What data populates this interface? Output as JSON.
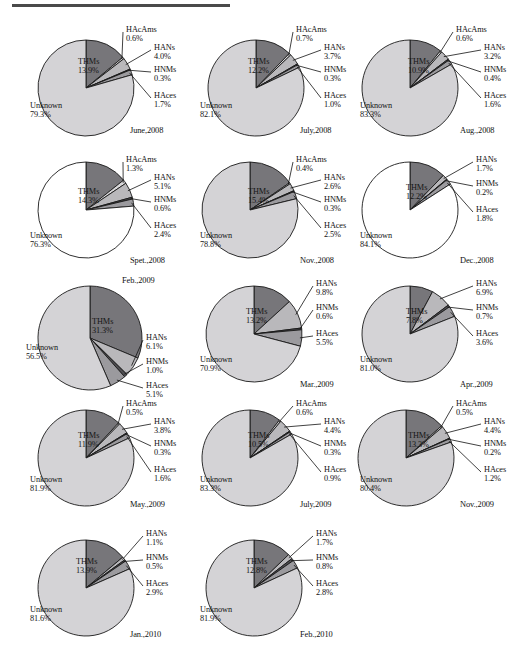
{
  "figure": {
    "title_rule": true,
    "series_names": [
      "THMs",
      "HAcAms",
      "HANs",
      "HNMs",
      "HAces",
      "Unknown"
    ],
    "colors": {
      "THMs": "#77767a",
      "HAcAms": "#d8d7d9",
      "HANs": "#b9b8bb",
      "HNMs": "#4f4e52",
      "HAces": "#9b9a9e",
      "Unknown_gray": "#d4d3d6",
      "Unknown_white": "#ffffff",
      "outline": "#1a1a1a"
    }
  },
  "chart_data": [
    {
      "type": "pie",
      "title": "June,2008",
      "unknown_fill": "gray",
      "categories": [
        "THMs",
        "HAcAms",
        "HANs",
        "HNMs",
        "HAces",
        "Unknown"
      ],
      "values": [
        13.9,
        0.6,
        4.0,
        0.3,
        1.7,
        79.3
      ],
      "labels": [
        "THMs",
        "HAcAms",
        "HANs",
        "HNMs",
        "HAces",
        "Unknown"
      ],
      "value_labels": [
        "13.9%",
        "0.6%",
        "4.0%",
        "0.3%",
        "1.7%",
        "79.3%"
      ]
    },
    {
      "type": "pie",
      "title": "July,2008",
      "unknown_fill": "gray",
      "categories": [
        "THMs",
        "HAcAms",
        "HANs",
        "HNMs",
        "HAces",
        "Unknown"
      ],
      "values": [
        12.2,
        0.7,
        3.7,
        0.3,
        1.0,
        82.1
      ],
      "labels": [
        "THMs",
        "HAcAms",
        "HANs",
        "HNMs",
        "HAces",
        "Unknown"
      ],
      "value_labels": [
        "12.2%",
        "0.7%",
        "3.7%",
        "0.3%",
        "1.0%",
        "82.1%"
      ]
    },
    {
      "type": "pie",
      "title": "Aug.,2008",
      "unknown_fill": "gray",
      "categories": [
        "THMs",
        "HAcAms",
        "HANs",
        "HNMs",
        "HAces",
        "Unknown"
      ],
      "values": [
        10.9,
        0.6,
        3.2,
        0.4,
        1.6,
        83.3
      ],
      "labels": [
        "THMs",
        "HAcAms",
        "HANs",
        "HNMs",
        "HAces",
        "Unknown"
      ],
      "value_labels": [
        "10.9%",
        "0.6%",
        "3.2%",
        "0.4%",
        "1.6%",
        "83.3%"
      ]
    },
    {
      "type": "pie",
      "title": "Spet.,2008",
      "unknown_fill": "white",
      "categories": [
        "THMs",
        "HAcAms",
        "HANs",
        "HNMs",
        "HAces",
        "Unknown"
      ],
      "values": [
        14.3,
        1.3,
        5.1,
        0.6,
        2.4,
        76.3
      ],
      "labels": [
        "THMs",
        "HAcAms",
        "HANs",
        "HNMs",
        "HAces",
        "Unknown"
      ],
      "value_labels": [
        "14.3%",
        "1.3%",
        "5.1%",
        "0.6%",
        "2.4%",
        "76.3%"
      ]
    },
    {
      "type": "pie",
      "title": "Nov.,2008",
      "unknown_fill": "gray",
      "categories": [
        "THMs",
        "HAcAms",
        "HANs",
        "HNMs",
        "HAces",
        "Unknown"
      ],
      "values": [
        15.4,
        0.4,
        2.6,
        0.3,
        2.5,
        78.8
      ],
      "labels": [
        "THMs",
        "HAcAms",
        "HANs",
        "HNMs",
        "HAces",
        "Unknown"
      ],
      "value_labels": [
        "15.4%",
        "0.4%",
        "2.6%",
        "0.3%",
        "2.5%",
        "78.8%"
      ]
    },
    {
      "type": "pie",
      "title": "Dec.,2008",
      "unknown_fill": "white",
      "categories": [
        "THMs",
        "HANs",
        "HNMs",
        "HAces",
        "Unknown"
      ],
      "values": [
        12.2,
        1.7,
        0.2,
        1.8,
        84.1
      ],
      "labels": [
        "THMs",
        "HANs",
        "HNMs",
        "HAces",
        "Unknown"
      ],
      "value_labels": [
        "12.2%",
        "1.7%",
        "0.2%",
        "1.8%",
        "84.1%"
      ]
    },
    {
      "type": "pie",
      "title": "Feb.,2009",
      "unknown_fill": "gray",
      "categories": [
        "THMs",
        "HANs",
        "HNMs",
        "HAces",
        "Unknown"
      ],
      "values": [
        31.3,
        6.1,
        1.0,
        5.1,
        56.5
      ],
      "labels": [
        "THMs",
        "HANs",
        "HNMs",
        "HAces",
        "Unknown"
      ],
      "value_labels": [
        "31.3%",
        "6.1%",
        "1.0%",
        "5.1%",
        "56.5%"
      ]
    },
    {
      "type": "pie",
      "title": "Mar.,2009",
      "unknown_fill": "gray",
      "categories": [
        "THMs",
        "HANs",
        "HNMs",
        "HAces",
        "Unknown"
      ],
      "values": [
        13.2,
        9.8,
        0.6,
        5.5,
        70.9
      ],
      "labels": [
        "THMs",
        "HANs",
        "HNMs",
        "HAces",
        "Unknown"
      ],
      "value_labels": [
        "13.2%",
        "9.8%",
        "0.6%",
        "5.5%",
        "70.9%"
      ]
    },
    {
      "type": "pie",
      "title": "Apr.,2009",
      "unknown_fill": "gray",
      "categories": [
        "THMs",
        "HANs",
        "HNMs",
        "HAces",
        "Unknown"
      ],
      "values": [
        7.8,
        6.9,
        0.7,
        3.6,
        81.0
      ],
      "labels": [
        "THMs",
        "HANs",
        "HNMs",
        "HAces",
        "Unknown"
      ],
      "value_labels": [
        "7.8%",
        "6.9%",
        "0.7%",
        "3.6%",
        "81.0%"
      ]
    },
    {
      "type": "pie",
      "title": "May.,2009",
      "unknown_fill": "gray",
      "categories": [
        "THMs",
        "HAcAms",
        "HANs",
        "HNMs",
        "HAces",
        "Unknown"
      ],
      "values": [
        11.9,
        0.5,
        3.8,
        0.3,
        1.6,
        81.9
      ],
      "labels": [
        "THMs",
        "HAcAms",
        "HANs",
        "HNMs",
        "HAces",
        "Unknown"
      ],
      "value_labels": [
        "11.9%",
        "0.5%",
        "3.8%",
        "0.3%",
        "1.6%",
        "81.9%"
      ]
    },
    {
      "type": "pie",
      "title": "July,2009",
      "unknown_fill": "gray",
      "categories": [
        "THMs",
        "HAcAms",
        "HANs",
        "HNMs",
        "HAces",
        "Unknown"
      ],
      "values": [
        10.5,
        0.6,
        4.4,
        0.3,
        0.9,
        83.3
      ],
      "labels": [
        "THMs",
        "HAcAms",
        "HANs",
        "HNMs",
        "HAces",
        "Unknown"
      ],
      "value_labels": [
        "10.5%",
        "0.6%",
        "4.4%",
        "0.3%",
        "0.9%",
        "83.3%"
      ]
    },
    {
      "type": "pie",
      "title": "Nov.,2009",
      "unknown_fill": "gray",
      "categories": [
        "THMs",
        "HAcAms",
        "HANs",
        "HNMs",
        "HAces",
        "Unknown"
      ],
      "values": [
        13.3,
        0.5,
        4.4,
        0.2,
        1.2,
        80.4
      ],
      "labels": [
        "THMs",
        "HAcAms",
        "HANs",
        "HNMs",
        "HAces",
        "Unknown"
      ],
      "value_labels": [
        "13.3%",
        "0.5%",
        "4.4%",
        "0.2%",
        "1.2%",
        "80.4%"
      ]
    },
    {
      "type": "pie",
      "title": "Jan.,2010",
      "unknown_fill": "gray",
      "categories": [
        "THMs",
        "HANs",
        "HNMs",
        "HAces",
        "Unknown"
      ],
      "values": [
        13.9,
        1.1,
        0.5,
        2.9,
        81.6
      ],
      "labels": [
        "THMs",
        "HANs",
        "HNMs",
        "HAces",
        "Unknown"
      ],
      "value_labels": [
        "13.9%",
        "1.1%",
        "0.5%",
        "2.9%",
        "81.6%"
      ]
    },
    {
      "type": "pie",
      "title": "Feb.,2010",
      "unknown_fill": "gray",
      "categories": [
        "THMs",
        "HANs",
        "HNMs",
        "HAces",
        "Unknown"
      ],
      "values": [
        12.8,
        1.7,
        0.8,
        2.8,
        81.9
      ],
      "labels": [
        "THMs",
        "HANs",
        "HNMs",
        "HAces",
        "Unknown"
      ],
      "value_labels": [
        "12.8%",
        "1.7%",
        "0.8%",
        "2.8%",
        "81.9%"
      ]
    }
  ],
  "layout": {
    "cells": [
      {
        "x": 18,
        "y": 18,
        "cx": 68,
        "cy": 70,
        "r": 48,
        "start": 0,
        "variant": "A"
      },
      {
        "x": 188,
        "y": 18,
        "cx": 68,
        "cy": 70,
        "r": 48,
        "start": 0,
        "variant": "A"
      },
      {
        "x": 348,
        "y": 18,
        "cx": 62,
        "cy": 70,
        "r": 48,
        "start": 0,
        "variant": "A"
      },
      {
        "x": 18,
        "y": 148,
        "cx": 68,
        "cy": 62,
        "r": 48,
        "start": 0,
        "variant": "A"
      },
      {
        "x": 188,
        "y": 148,
        "cx": 62,
        "cy": 62,
        "r": 48,
        "start": 0,
        "variant": "A"
      },
      {
        "x": 348,
        "y": 148,
        "cx": 62,
        "cy": 62,
        "r": 48,
        "start": 0,
        "variant": "B"
      },
      {
        "x": 18,
        "y": 272,
        "cx": 72,
        "cy": 66,
        "r": 52,
        "start": 0,
        "variant": "C"
      },
      {
        "x": 188,
        "y": 272,
        "cx": 66,
        "cy": 62,
        "r": 48,
        "start": 0,
        "variant": "B"
      },
      {
        "x": 348,
        "y": 272,
        "cx": 62,
        "cy": 62,
        "r": 48,
        "start": 0,
        "variant": "B"
      },
      {
        "x": 18,
        "y": 392,
        "cx": 68,
        "cy": 66,
        "r": 48,
        "start": 0,
        "variant": "A"
      },
      {
        "x": 188,
        "y": 392,
        "cx": 62,
        "cy": 66,
        "r": 48,
        "start": 0,
        "variant": "A"
      },
      {
        "x": 348,
        "y": 392,
        "cx": 58,
        "cy": 66,
        "r": 48,
        "start": 0,
        "variant": "A"
      },
      {
        "x": 18,
        "y": 522,
        "cx": 68,
        "cy": 66,
        "r": 48,
        "start": 0,
        "variant": "B"
      },
      {
        "x": 188,
        "y": 522,
        "cx": 66,
        "cy": 66,
        "r": 48,
        "start": 0,
        "variant": "B"
      }
    ]
  }
}
